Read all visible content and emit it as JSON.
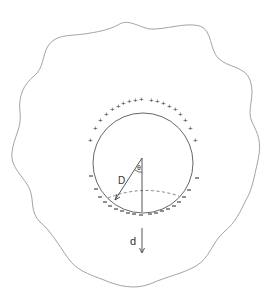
{
  "diagram": {
    "type": "physics-sketch",
    "labels": {
      "radius_label": "D",
      "angle_label": "θ",
      "displacement_label": "d"
    },
    "charges": {
      "positive_symbol": "+",
      "negative_symbol": "–",
      "positive_count": 20,
      "negative_count": 20
    },
    "colors": {
      "outline": "#888888",
      "ink": "#333333",
      "background": "#ffffff"
    }
  }
}
